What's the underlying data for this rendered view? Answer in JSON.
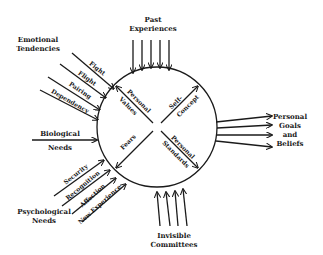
{
  "diagram": {
    "type": "concept-diagram",
    "center_circle": {
      "quadrants": {
        "top_left": "Personal Values",
        "top_right": "Self-Concept",
        "bottom_left": "Fears",
        "bottom_right": "Personal Standards"
      },
      "quadrant_lines": {
        "top_left": [
          "Personal",
          "Values"
        ],
        "top_right": [
          "Self-",
          "Concept"
        ],
        "bottom_left": [
          "Fears"
        ],
        "bottom_right": [
          "Personal",
          "Standards"
        ]
      }
    },
    "inputs": {
      "past_experiences": {
        "label_lines": [
          "Past",
          "Experiences"
        ],
        "arrow_count": 5
      },
      "emotional_tendencies": {
        "label_lines": [
          "Emotional",
          "Tendencies"
        ],
        "items": [
          "Fight",
          "Flight",
          "Pairing",
          "Dependency"
        ]
      },
      "biological_needs": {
        "label_lines": [
          "Biological",
          "Needs"
        ]
      },
      "psychological_needs": {
        "label_lines": [
          "Psychological",
          "Needs"
        ],
        "items": [
          "Security",
          "Recognition",
          "Affection",
          "New Experience"
        ]
      },
      "invisible_committees": {
        "label_lines": [
          "Invisible",
          "Committees"
        ],
        "arrow_count": 4
      }
    },
    "outputs": {
      "personal_goals_and_beliefs": {
        "label_lines": [
          "Personal",
          "Goals",
          "and",
          "Beliefs"
        ],
        "arrow_count": 4
      }
    },
    "colors": {
      "ink": "#1a1a1a",
      "background": "#ffffff"
    }
  }
}
